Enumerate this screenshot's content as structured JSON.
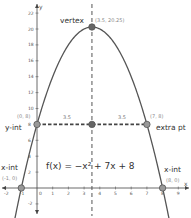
{
  "chart_data": {
    "type": "line",
    "title": "",
    "equation": "f(x) = −x² + 7x + 8",
    "xlabel": "x",
    "ylabel": "y",
    "xlim": [
      -2.3,
      9.7
    ],
    "ylim": [
      -3.5,
      23.5
    ],
    "x_ticks": [
      -2,
      -1,
      0,
      1,
      2,
      3,
      4,
      5,
      6,
      7,
      8,
      9
    ],
    "y_ticks": [
      -2,
      0,
      2,
      4,
      6,
      8,
      10,
      12,
      14,
      16,
      18,
      20,
      22
    ],
    "grid": false,
    "series": [
      {
        "name": "f(x) = -x^2 + 7x + 8",
        "coefficients": {
          "a": -1,
          "b": 7,
          "c": 8
        }
      }
    ],
    "axis_of_symmetry": {
      "x": 3.5,
      "style": "dashed"
    },
    "points": [
      {
        "name": "vertex",
        "label": "vertex",
        "coord_label": "(3.5, 20.25)",
        "x": 3.5,
        "y": 20.25
      },
      {
        "name": "y-intercept",
        "label": "y-int",
        "coord_label": "(0, 8)",
        "x": 0,
        "y": 8
      },
      {
        "name": "extra point",
        "label": "extra pt",
        "coord_label": "(7, 8)",
        "x": 7,
        "y": 8
      },
      {
        "name": "x-intercept-left",
        "label": "x-int",
        "coord_label": "(-1, 0)",
        "x": -1,
        "y": 0
      },
      {
        "name": "x-intercept-right",
        "label": "x-int",
        "coord_label": "(8, 0)",
        "x": 8,
        "y": 0
      },
      {
        "name": "symmetry-point",
        "label": "",
        "coord_label": "",
        "x": 3.5,
        "y": 8
      }
    ],
    "annotations": [
      {
        "text": "3.5",
        "between": "y-int and axis of symmetry"
      },
      {
        "text": "3.5",
        "between": "axis of symmetry and extra pt"
      }
    ]
  },
  "labels": {
    "vertex": "vertex",
    "vertex_coord": "(3.5, 20.25)",
    "yint": "y-int",
    "yint_coord": "(0, 8)",
    "extra": "extra pt",
    "extra_coord": "(7, 8)",
    "xint_left": "x-int",
    "xint_left_coord": "(-1, 0)",
    "xint_right": "x-int",
    "xint_right_coord": "(8, 0)",
    "dist_left": "3.5",
    "dist_right": "3.5",
    "equation": "f(x) = −x² + 7x + 8",
    "x_axis": "x",
    "y_axis": "y"
  },
  "colors": {
    "curve": "#555555",
    "axis": "#444444",
    "dashed": "#555555",
    "marker_fill": "#999999",
    "marker_stroke": "#555555"
  }
}
